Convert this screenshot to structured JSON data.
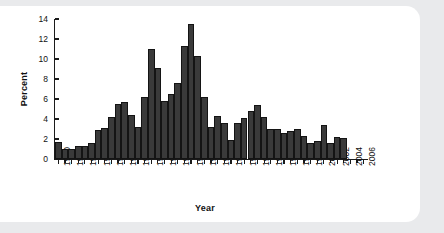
{
  "chart_data": {
    "type": "bar",
    "title": "",
    "xlabel": "Year",
    "ylabel": "Percent",
    "ylim": [
      0,
      14
    ],
    "yticks": [
      0,
      2,
      4,
      6,
      8,
      10,
      12,
      14
    ],
    "xlim": [
      1959.5,
      2006.5
    ],
    "xticks": [
      1960,
      1962,
      1964,
      1966,
      1968,
      1970,
      1972,
      1974,
      1976,
      1978,
      1980,
      1982,
      1984,
      1986,
      1988,
      1990,
      1992,
      1994,
      1996,
      1998,
      2000,
      2002,
      2004,
      2006
    ],
    "xtick_labels": [
      "1960",
      "1962",
      "1964",
      "1966",
      "1968",
      "1970",
      "1972",
      "1974",
      "1976",
      "1978",
      "1980",
      "1982",
      "1984",
      "1986",
      "1988",
      "1990",
      "1992",
      "1994",
      "1996",
      "1998",
      "2000",
      "2002",
      "2004",
      "2006"
    ],
    "grid": false,
    "legend": null,
    "bar_color": "#3a3a3a",
    "bar_edge_color": "#141414",
    "categories": [
      1960,
      1961,
      1962,
      1963,
      1964,
      1965,
      1966,
      1967,
      1968,
      1969,
      1970,
      1971,
      1972,
      1973,
      1974,
      1975,
      1976,
      1977,
      1978,
      1979,
      1980,
      1981,
      1982,
      1983,
      1984,
      1985,
      1986,
      1987,
      1988,
      1989,
      1990,
      1991,
      1992,
      1993,
      1994,
      1995,
      1996,
      1997,
      1998,
      1999,
      2000,
      2001,
      2002,
      2003
    ],
    "values": [
      1.7,
      1.0,
      1.0,
      1.3,
      1.3,
      1.6,
      2.9,
      3.1,
      4.2,
      5.5,
      5.7,
      4.4,
      3.2,
      6.2,
      11.0,
      9.1,
      5.8,
      6.5,
      7.6,
      11.3,
      13.5,
      10.3,
      6.2,
      3.2,
      4.3,
      3.6,
      1.9,
      3.6,
      4.1,
      4.8,
      5.4,
      4.2,
      3.0,
      3.0,
      2.6,
      2.8,
      3.0,
      2.3,
      1.6,
      1.8,
      3.4,
      1.6,
      2.2,
      2.1
    ]
  },
  "figure": {
    "background_color": "#e9eaec",
    "card_color": "#ffffff"
  }
}
